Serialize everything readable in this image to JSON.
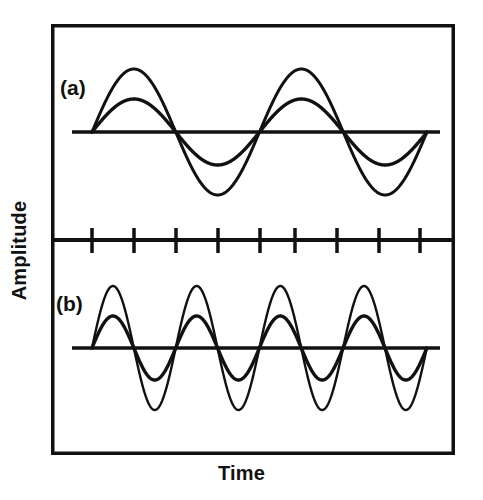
{
  "figure": {
    "title": "",
    "xlabel": "Time",
    "ylabel": "Amplitude",
    "panel_a_label": "(a)",
    "panel_b_label": "(b)",
    "frame_color": "#111111",
    "curve_color": "#111111",
    "background_color": "#ffffff"
  },
  "chart_data": {
    "type": "line",
    "title": "",
    "xlabel": "Time",
    "ylabel": "Amplitude",
    "grid": false,
    "legend": null,
    "axis_ticks": {
      "x_tick_count": 9,
      "x_tick_labels": [],
      "y_tick_labels": []
    },
    "panels": [
      {
        "id": "a",
        "label": "(a)",
        "description": "Two sine waves of equal frequency and different amplitudes",
        "baseline_y_value": 0,
        "cycles": 2,
        "x_range": [
          0,
          2
        ],
        "series": [
          {
            "name": "large-amplitude-wave",
            "amplitude": 1.0,
            "frequency": 1,
            "phase": 0,
            "waveform": "sine",
            "values": [
              0,
              0.71,
              1.0,
              0.71,
              0,
              -0.71,
              -1.0,
              -0.71,
              0,
              0.71,
              1.0,
              0.71,
              0,
              -0.71,
              -1.0,
              -0.71,
              0
            ]
          },
          {
            "name": "small-amplitude-wave",
            "amplitude": 0.52,
            "frequency": 1,
            "phase": 0,
            "waveform": "sine",
            "values": [
              0,
              0.37,
              0.52,
              0.37,
              0,
              -0.37,
              -0.52,
              -0.37,
              0,
              0.37,
              0.52,
              0.37,
              0,
              -0.37,
              -0.52,
              -0.37,
              0
            ]
          }
        ]
      },
      {
        "id": "b",
        "label": "(b)",
        "description": "Two sine waves of equal frequency (double that of panel a) and different amplitudes",
        "baseline_y_value": 0,
        "cycles": 4,
        "x_range": [
          0,
          4
        ],
        "series": [
          {
            "name": "large-amplitude-wave",
            "amplitude": 1.0,
            "frequency": 2,
            "phase": 0,
            "waveform": "sine",
            "values": [
              0,
              0.71,
              1.0,
              0.71,
              0,
              -0.71,
              -1.0,
              -0.71,
              0,
              0.71,
              1.0,
              0.71,
              0,
              -0.71,
              -1.0,
              -0.71,
              0,
              0.71,
              1.0,
              0.71,
              0,
              -0.71,
              -1.0,
              -0.71,
              0,
              0.71,
              1.0,
              0.71,
              0,
              -0.71,
              -1.0,
              -0.71,
              0
            ]
          },
          {
            "name": "small-amplitude-wave",
            "amplitude": 0.52,
            "frequency": 2,
            "phase": 0,
            "waveform": "sine",
            "values": [
              0,
              0.37,
              0.52,
              0.37,
              0,
              -0.37,
              -0.52,
              -0.37,
              0,
              0.37,
              0.52,
              0.37,
              0,
              -0.37,
              -0.52,
              -0.37,
              0,
              0.37,
              0.52,
              0.37,
              0,
              -0.37,
              -0.52,
              -0.37,
              0,
              0.37,
              0.52,
              0.37,
              0,
              -0.37,
              -0.52,
              -0.37,
              0
            ]
          }
        ]
      }
    ]
  },
  "geometry": {
    "frame": {
      "x": 51,
      "y": 24,
      "width": 404,
      "height": 431,
      "stroke": 3.5
    },
    "divider": {
      "y": 240,
      "x1": 51,
      "x2": 455,
      "stroke": 4
    },
    "ticks": {
      "y_top": 228,
      "y_bottom": 253,
      "stroke": 3.5,
      "positions": [
        92,
        134,
        176,
        218,
        260,
        295,
        337,
        379,
        420
      ]
    },
    "panel_a": {
      "baseline_y": 132,
      "x_start": 72,
      "x_end": 440,
      "wave_start": 92,
      "wavelength": 167.5,
      "amp_large": 63,
      "amp_small": 33,
      "stroke": 3
    },
    "panel_b": {
      "baseline_y": 348,
      "x_start": 72,
      "x_end": 440,
      "wave_start": 92,
      "wavelength": 83.7,
      "amp_large": 62,
      "amp_small": 32,
      "stroke": 3
    }
  }
}
